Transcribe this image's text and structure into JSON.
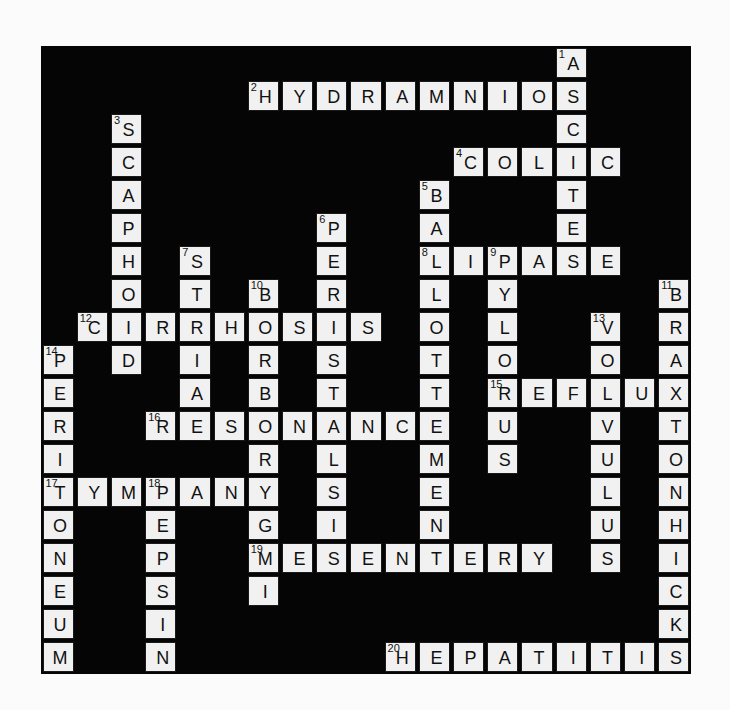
{
  "puzzle": {
    "rows": 19,
    "cols": 19,
    "across": [
      {
        "number": 2,
        "answer": "HYDRAMNIOS",
        "row": 1,
        "col": 6
      },
      {
        "number": 4,
        "answer": "COLIC",
        "row": 3,
        "col": 12
      },
      {
        "number": 8,
        "answer": "LIPASE",
        "row": 6,
        "col": 11
      },
      {
        "number": 12,
        "answer": "CIRRHOSIS",
        "row": 8,
        "col": 1
      },
      {
        "number": 15,
        "answer": "REFLUX",
        "row": 10,
        "col": 13
      },
      {
        "number": 16,
        "answer": "RESONANCE",
        "row": 11,
        "col": 3
      },
      {
        "number": 17,
        "answer": "TYMPANY",
        "row": 13,
        "col": 0
      },
      {
        "number": 19,
        "answer": "MESENTERY",
        "row": 15,
        "col": 6
      },
      {
        "number": 20,
        "answer": "HEPATITIS",
        "row": 18,
        "col": 10
      }
    ],
    "down": [
      {
        "number": 1,
        "answer": "ASCITES",
        "row": 0,
        "col": 15
      },
      {
        "number": 3,
        "answer": "SCAPHOID",
        "row": 2,
        "col": 2
      },
      {
        "number": 5,
        "answer": "BALLOTTEMENT",
        "row": 4,
        "col": 11
      },
      {
        "number": 6,
        "answer": "PERISTALSIS",
        "row": 5,
        "col": 8
      },
      {
        "number": 7,
        "answer": "STRIA",
        "row": 6,
        "col": 4
      },
      {
        "number": 9,
        "answer": "PYLORUS",
        "row": 6,
        "col": 13
      },
      {
        "number": 10,
        "answer": "BORBORYGMI",
        "row": 7,
        "col": 6
      },
      {
        "number": 11,
        "answer": "BRAXTONHICKS",
        "row": 7,
        "col": 18
      },
      {
        "number": 13,
        "answer": "VOLVULUS",
        "row": 8,
        "col": 16
      },
      {
        "number": 14,
        "answer": "PERITONEUM",
        "row": 9,
        "col": 0
      },
      {
        "number": 18,
        "answer": "PEPSIN",
        "row": 13,
        "col": 3
      }
    ]
  }
}
